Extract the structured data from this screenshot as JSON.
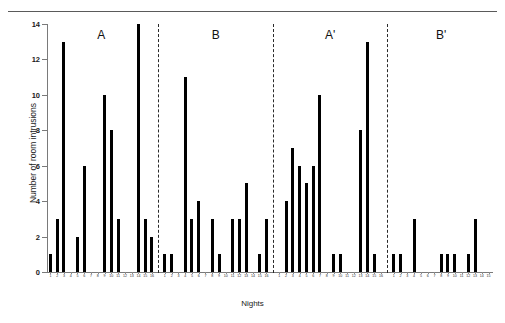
{
  "figure": {
    "y_axis_title": "Number of room intrusions",
    "x_axis_title": "Nights"
  },
  "chart_data": {
    "type": "bar",
    "title": "",
    "xlabel": "Nights",
    "ylabel": "Number of room intrusions",
    "ylim": [
      0,
      14
    ],
    "yticks": [
      0,
      2,
      4,
      6,
      8,
      10,
      12,
      14
    ],
    "ytick_labels": [
      "0",
      "2",
      "4",
      "6",
      "8",
      "10",
      "12",
      "14"
    ],
    "grid": false,
    "legend": "none",
    "bar_color": "#000000",
    "design": "ABAB reversal (single-subject)",
    "phase_labels": [
      "A",
      "B",
      "A'",
      "B'"
    ],
    "phases": [
      {
        "name": "A",
        "label": "A",
        "categories": [
          "1",
          "2",
          "3",
          "4",
          "5",
          "6",
          "7",
          "8",
          "9",
          "10",
          "11",
          "12",
          "13",
          "14",
          "15",
          "16"
        ],
        "values": [
          1,
          3,
          13,
          0,
          2,
          6,
          0,
          0,
          10,
          8,
          3,
          0,
          0,
          14,
          3,
          2
        ]
      },
      {
        "name": "B",
        "label": "B",
        "categories": [
          "1",
          "2",
          "3",
          "4",
          "5",
          "6",
          "7",
          "8",
          "9",
          "10",
          "11",
          "12",
          "13",
          "14",
          "15",
          "16"
        ],
        "values": [
          1,
          1,
          0,
          11,
          3,
          4,
          0,
          3,
          1,
          0,
          3,
          3,
          5,
          0,
          1,
          3
        ]
      },
      {
        "name": "A'",
        "label": "A'",
        "categories": [
          "1",
          "2",
          "3",
          "4",
          "5",
          "6",
          "7",
          "8",
          "9",
          "10",
          "11",
          "12",
          "13",
          "14",
          "15",
          "16"
        ],
        "values": [
          0,
          4,
          7,
          6,
          5,
          6,
          10,
          0,
          1,
          1,
          0,
          0,
          8,
          13,
          1,
          0
        ]
      },
      {
        "name": "B'",
        "label": "B'",
        "categories": [
          "1",
          "2",
          "3",
          "4",
          "5",
          "6",
          "7",
          "8",
          "9",
          "10",
          "11",
          "12",
          "13",
          "14",
          "15"
        ],
        "values": [
          1,
          1,
          0,
          3,
          0,
          0,
          0,
          1,
          1,
          1,
          0,
          1,
          3,
          0,
          0
        ]
      }
    ]
  }
}
